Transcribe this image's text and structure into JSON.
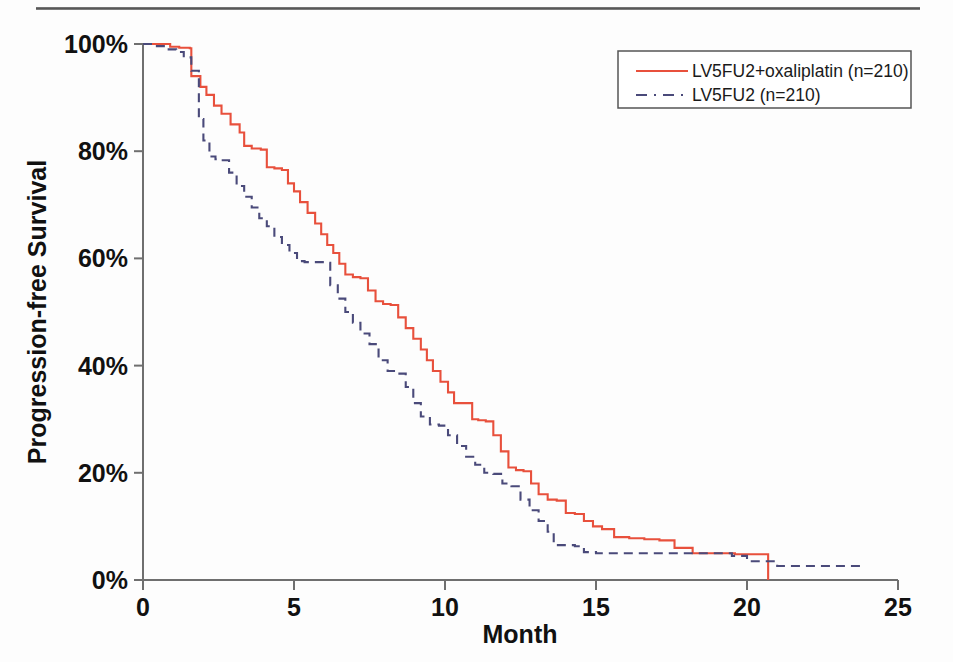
{
  "figure": {
    "background_color": "#fdfdfd",
    "axis_color": "#6f6f6f",
    "text_color": "#111111"
  },
  "legend": {
    "position": "top-right",
    "border_color": "#555555",
    "entries": [
      {
        "label": "LV5FU2+oxaliplatin (n=210)",
        "color": "#E8503C",
        "style": "solid"
      },
      {
        "label": "LV5FU2 (n=210)",
        "color": "#4A4A7A",
        "style": "dashed"
      }
    ]
  },
  "axes": {
    "x": {
      "title": "Month",
      "ticks": [
        "0",
        "5",
        "10",
        "15",
        "20",
        "25"
      ],
      "tick_values": [
        0,
        5,
        10,
        15,
        20,
        25
      ],
      "min": 0,
      "max": 25
    },
    "y": {
      "title": "Progression-free Survival",
      "ticks": [
        "0%",
        "20%",
        "40%",
        "60%",
        "80%",
        "100%"
      ],
      "tick_values": [
        0,
        20,
        40,
        60,
        80,
        100
      ],
      "min": 0,
      "max": 100
    }
  },
  "chart_data": {
    "type": "line",
    "subtype": "kaplan-meier-step",
    "title": "",
    "xlabel": "Month",
    "ylabel": "Progression-free Survival",
    "xlim": [
      0,
      25
    ],
    "ylim": [
      0,
      100
    ],
    "grid": false,
    "legend_position": "top-right",
    "series": [
      {
        "name": "LV5FU2+oxaliplatin (n=210)",
        "color": "#E8503C",
        "style": "solid",
        "n": 210,
        "x": [
          0.0,
          0.5,
          0.9,
          1.2,
          1.55,
          1.6,
          1.9,
          2.1,
          2.35,
          2.6,
          2.9,
          3.2,
          3.35,
          3.6,
          3.9,
          4.1,
          4.35,
          4.6,
          4.8,
          5.0,
          5.2,
          5.45,
          5.7,
          5.9,
          6.1,
          6.3,
          6.5,
          6.7,
          6.95,
          7.2,
          7.45,
          7.7,
          7.95,
          8.2,
          8.45,
          8.7,
          8.95,
          9.2,
          9.4,
          9.6,
          9.85,
          10.1,
          10.3,
          10.9,
          11.1,
          11.35,
          11.6,
          11.85,
          12.1,
          12.35,
          12.6,
          12.85,
          13.1,
          13.4,
          13.7,
          14.0,
          14.3,
          14.6,
          14.9,
          15.2,
          15.6,
          16.1,
          16.6,
          17.1,
          17.6,
          18.2,
          19.0,
          19.6,
          20.7,
          20.7
        ],
        "y": [
          100,
          100,
          99.5,
          99.3,
          99.2,
          94.0,
          92.0,
          90.5,
          88.5,
          87.0,
          85.0,
          83.5,
          81.0,
          80.5,
          80.3,
          77.0,
          76.8,
          76.5,
          74.0,
          72.5,
          70.5,
          68.5,
          66.5,
          64.5,
          62.5,
          61.0,
          59.0,
          57.0,
          56.5,
          56.3,
          54.0,
          52.0,
          51.5,
          51.3,
          49.0,
          47.0,
          45.0,
          43.0,
          41.0,
          39.0,
          37.0,
          35.0,
          33.0,
          30.0,
          29.8,
          29.6,
          27.0,
          24.0,
          21.0,
          20.5,
          20.3,
          18.0,
          16.0,
          15.0,
          14.8,
          12.5,
          12.3,
          11.0,
          10.0,
          9.5,
          8.0,
          7.8,
          7.6,
          7.4,
          6.0,
          5.0,
          5.0,
          4.8,
          4.8,
          0.0
        ]
      },
      {
        "name": "LV5FU2 (n=210)",
        "color": "#4A4A7A",
        "style": "dashed",
        "n": 210,
        "x": [
          0.0,
          0.4,
          0.8,
          1.1,
          1.35,
          1.6,
          1.85,
          2.0,
          2.2,
          2.4,
          2.6,
          2.85,
          3.1,
          3.35,
          3.6,
          3.85,
          4.1,
          4.35,
          4.6,
          4.85,
          5.1,
          5.35,
          6.0,
          6.2,
          6.45,
          6.7,
          6.95,
          7.2,
          7.5,
          7.8,
          8.1,
          8.4,
          8.7,
          8.95,
          9.2,
          9.5,
          9.8,
          10.1,
          10.4,
          10.7,
          11.0,
          11.3,
          11.6,
          11.9,
          12.2,
          12.5,
          12.8,
          13.1,
          13.4,
          13.6,
          14.3,
          14.6,
          15.0,
          16.0,
          17.0,
          18.0,
          19.5,
          20.0,
          21.0,
          22.0,
          23.0,
          23.9
        ],
        "y": [
          100,
          99.6,
          99.0,
          98.5,
          97.5,
          95.0,
          86.0,
          82.0,
          79.0,
          78.5,
          78.3,
          76.0,
          73.5,
          71.5,
          69.5,
          67.5,
          66.0,
          64.0,
          62.5,
          61.0,
          59.5,
          59.3,
          59.2,
          55.0,
          52.5,
          50.0,
          48.0,
          46.0,
          44.0,
          41.0,
          39.0,
          38.5,
          36.0,
          33.0,
          30.5,
          29.0,
          28.8,
          27.0,
          25.0,
          23.0,
          21.5,
          20.0,
          19.8,
          18.0,
          17.5,
          15.0,
          13.0,
          11.0,
          9.0,
          6.5,
          6.3,
          5.2,
          5.0,
          5.0,
          5.0,
          5.0,
          4.5,
          3.5,
          2.6,
          2.6,
          2.6,
          2.6
        ]
      }
    ]
  }
}
